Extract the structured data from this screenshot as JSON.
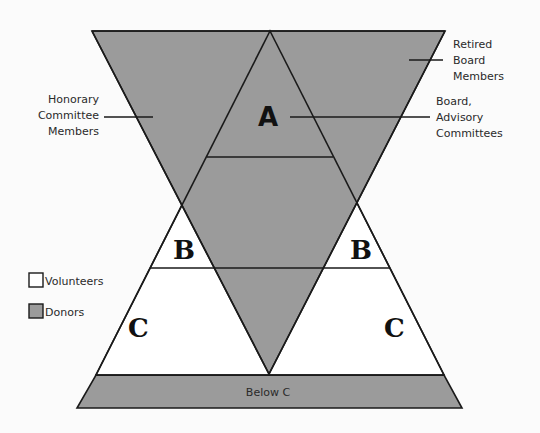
{
  "colors": {
    "donor_fill": "#9b9b9b",
    "volunteer_fill": "#ffffff",
    "stroke": "#1a1a1a",
    "background": "#fbfbfb"
  },
  "labels": {
    "honorary": [
      "Honorary",
      "Committee",
      "Members"
    ],
    "retired": [
      "Retired",
      "Board",
      "Members"
    ],
    "board": [
      "Board,",
      "Advisory",
      "Committees"
    ],
    "below_c": "Below C"
  },
  "regions": {
    "a": "A",
    "b_left": "B",
    "b_right": "B",
    "c_left": "C",
    "c_right": "C"
  },
  "legend": [
    {
      "name": "Volunteers",
      "swatch": "white"
    },
    {
      "name": "Donors",
      "swatch": "gray"
    }
  ]
}
